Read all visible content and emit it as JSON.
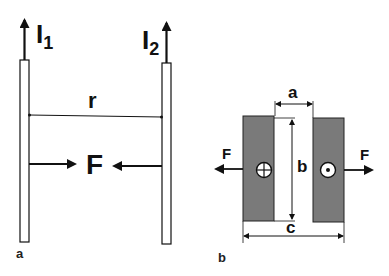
{
  "figure": {
    "panels": [
      {
        "id": "a",
        "panel_label": "a",
        "description": "Two parallel thin conductors carrying currents in the same direction attract each other",
        "conductor_1": {
          "current_label": "I",
          "subscript": "1",
          "current_direction": "up"
        },
        "conductor_2": {
          "current_label": "I",
          "subscript": "2",
          "current_direction": "up"
        },
        "separation_label": "r",
        "force_label": "F",
        "force_direction": "attraction"
      },
      {
        "id": "b",
        "panel_label": "b",
        "description": "Cross-section of two wide strip conductors carrying opposite currents repel each other",
        "left_conductor": {
          "current_symbol": "into-page (⊕)"
        },
        "right_conductor": {
          "current_symbol": "out-of-page (⊙)"
        },
        "gap_label": "a",
        "height_label": "b",
        "total_width_label": "c",
        "force_label_left": "F",
        "force_label_right": "F",
        "force_direction": "repulsion"
      }
    ],
    "colors": {
      "line": "#111111",
      "conductor_fill": "#7a7a7a",
      "background": "#ffffff"
    }
  }
}
